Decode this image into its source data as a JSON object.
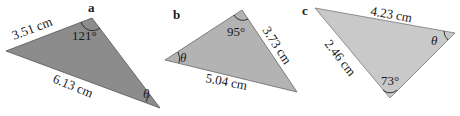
{
  "figure": {
    "triangles": [
      {
        "label": "a",
        "fill": "#8c8c8c",
        "vertices": [
          [
            6,
            51
          ],
          [
            92,
            18
          ],
          [
            160,
            108
          ]
        ],
        "sides": [
          "3.51 cm",
          "6.13 cm"
        ],
        "angles": [
          "121°",
          "θ"
        ]
      },
      {
        "label": "b",
        "fill": "#b3b3b3",
        "vertices": [
          [
            165,
            60
          ],
          [
            242,
            10
          ],
          [
            297,
            92
          ]
        ],
        "sides": [
          "3.73 cm",
          "5.04 cm"
        ],
        "angles": [
          "95°",
          "θ"
        ]
      },
      {
        "label": "c",
        "fill": "#c9c9c9",
        "vertices": [
          [
            315,
            8
          ],
          [
            455,
            33
          ],
          [
            390,
            98
          ]
        ],
        "sides": [
          "4.23 cm",
          "2.46 cm"
        ],
        "angles": [
          "73°",
          "θ"
        ]
      }
    ]
  }
}
